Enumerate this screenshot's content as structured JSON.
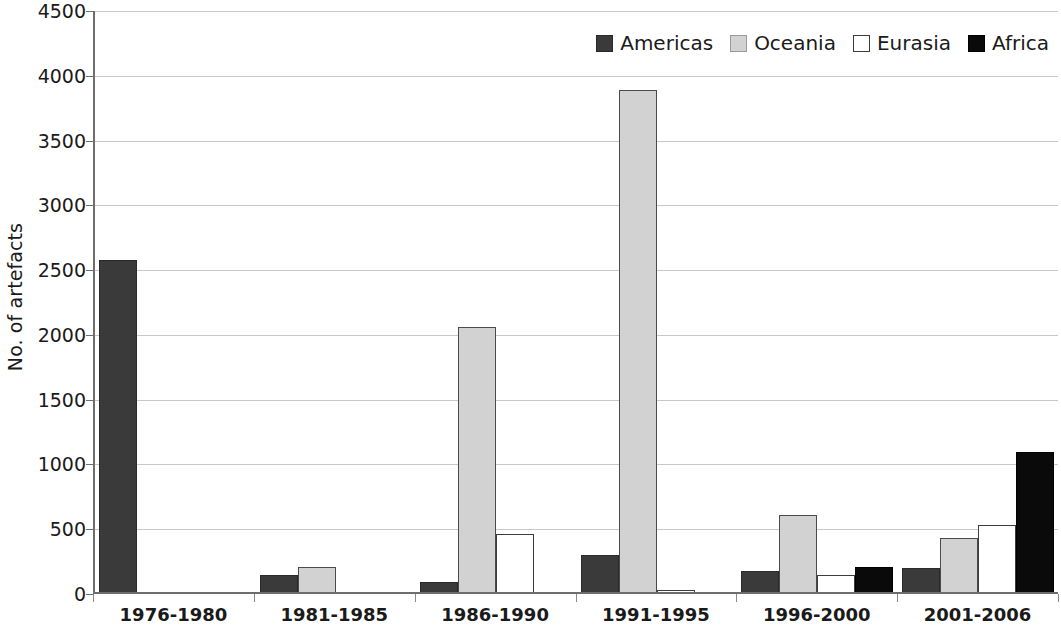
{
  "chart_data": {
    "type": "bar",
    "title": "",
    "xlabel": "",
    "ylabel": "No. of artefacts",
    "ylim": [
      0,
      4500
    ],
    "ytick_step": 500,
    "ytick_labels": [
      "4500",
      "4000",
      "3500",
      "3000",
      "2500",
      "2000",
      "1500",
      "1000",
      "500",
      "0"
    ],
    "grid": "horizontal",
    "legend_position": "top-right",
    "categories": [
      "1976-1980",
      "1981-1985",
      "1986-1990",
      "1991-1995",
      "1996-2000",
      "2001-2006"
    ],
    "series": [
      {
        "name": "Americas",
        "color": "#3a3a3a",
        "values": [
          2580,
          145,
          90,
          300,
          180,
          200
        ]
      },
      {
        "name": "Oceania",
        "color": "#d2d2d2",
        "values": [
          0,
          205,
          2060,
          3890,
          610,
          430
        ]
      },
      {
        "name": "Eurasia",
        "color": "#ffffff",
        "values": [
          0,
          0,
          465,
          30,
          150,
          530
        ]
      },
      {
        "name": "Africa",
        "color": "#0a0a0a",
        "values": [
          0,
          0,
          0,
          0,
          210,
          1100
        ]
      }
    ]
  }
}
